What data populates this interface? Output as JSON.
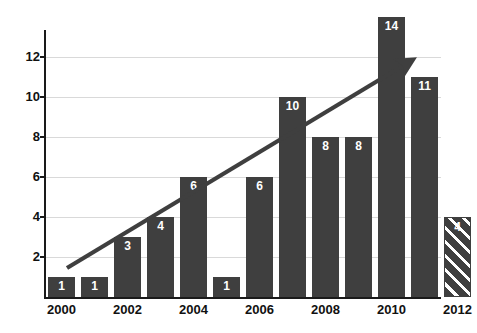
{
  "chart_data": {
    "type": "bar",
    "title": "",
    "xlabel": "",
    "ylabel": "",
    "ylim": [
      0,
      14
    ],
    "xlim": [
      2000,
      2012
    ],
    "grid": true,
    "legend": false,
    "y_ticks": [
      "2",
      "4",
      "6",
      "8",
      "10",
      "12"
    ],
    "y_tick_values": [
      2,
      4,
      6,
      8,
      10,
      12
    ],
    "x_tick_labels": [
      "2000",
      "2002",
      "2004",
      "2006",
      "2008",
      "2010",
      "2012"
    ],
    "categories": [
      "2000",
      "2001",
      "2002",
      "2003",
      "2004",
      "2005",
      "2006",
      "2007",
      "2008",
      "2009",
      "2010",
      "2011",
      "2012"
    ],
    "values": [
      1,
      1,
      3,
      4,
      6,
      1,
      6,
      10,
      8,
      8,
      14,
      11,
      4
    ],
    "data_labels": [
      "1",
      "1",
      "3",
      "4",
      "6",
      "1",
      "6",
      "10",
      "8",
      "8",
      "14",
      "11",
      "4"
    ],
    "bar_color": "#3f3f3f",
    "label_color": "#ffffff",
    "grid_color": "#d9d9d9",
    "axis_color": "#1a1a1a",
    "projected_index": 12,
    "projected_note": "hatched bar indicates projected value",
    "annotations": [
      {
        "name": "trend-arrow",
        "type": "arrow",
        "from": [
          2000.6,
          1.5
        ],
        "to": [
          2011.7,
          12.0
        ],
        "color": "#3f3f3f"
      }
    ]
  },
  "bars": [
    {
      "label": "2000",
      "value": 1,
      "text": "1",
      "projected": false
    },
    {
      "label": "2001",
      "value": 1,
      "text": "1",
      "projected": false
    },
    {
      "label": "2002",
      "value": 3,
      "text": "3",
      "projected": false
    },
    {
      "label": "2003",
      "value": 4,
      "text": "4",
      "projected": false
    },
    {
      "label": "2004",
      "value": 6,
      "text": "6",
      "projected": false
    },
    {
      "label": "2005",
      "value": 1,
      "text": "1",
      "projected": false
    },
    {
      "label": "2006",
      "value": 6,
      "text": "6",
      "projected": false
    },
    {
      "label": "2007",
      "value": 10,
      "text": "10",
      "projected": false
    },
    {
      "label": "2008",
      "value": 8,
      "text": "8",
      "projected": false
    },
    {
      "label": "2009",
      "value": 8,
      "text": "8",
      "projected": false
    },
    {
      "label": "2010",
      "value": 14,
      "text": "14",
      "projected": false
    },
    {
      "label": "2011",
      "value": 11,
      "text": "11",
      "projected": false
    },
    {
      "label": "2012",
      "value": 4,
      "text": "4",
      "projected": true
    }
  ],
  "y_axis": {
    "ticks": [
      {
        "text": "12",
        "value": 12
      },
      {
        "text": "10",
        "value": 10
      },
      {
        "text": "8",
        "value": 8
      },
      {
        "text": "6",
        "value": 6
      },
      {
        "text": "4",
        "value": 4
      },
      {
        "text": "2",
        "value": 2
      }
    ]
  },
  "x_axis": {
    "ticks": [
      {
        "text": "2000",
        "index": 0
      },
      {
        "text": "2002",
        "index": 2
      },
      {
        "text": "2004",
        "index": 4
      },
      {
        "text": "2006",
        "index": 6
      },
      {
        "text": "2008",
        "index": 8
      },
      {
        "text": "2010",
        "index": 10
      },
      {
        "text": "2012",
        "index": 12
      }
    ]
  },
  "title": ""
}
